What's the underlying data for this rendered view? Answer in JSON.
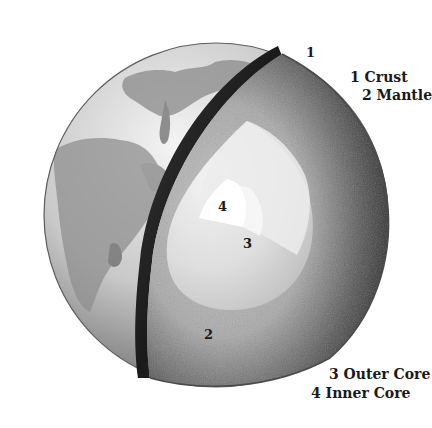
{
  "diagram": {
    "layer_markers": [
      {
        "id": "1",
        "text": "1"
      },
      {
        "id": "2",
        "text": "2"
      },
      {
        "id": "3",
        "text": "3"
      },
      {
        "id": "4",
        "text": "4"
      }
    ],
    "legend": [
      {
        "number": "1",
        "label": "Crust",
        "text": "1 Crust"
      },
      {
        "number": "2",
        "label": "Mantle",
        "text": "2 Mantle"
      },
      {
        "number": "3",
        "label": "Outer Core",
        "text": "3 Outer Core"
      },
      {
        "number": "4",
        "label": "Inner Core",
        "text": "4 Inner Core"
      }
    ],
    "colors": {
      "background": "#ffffff",
      "surface_light": "#e6e6e6",
      "surface_dark": "#7a7a7a",
      "crust_edge": "#6e6e6e",
      "mantle_dark": "#2a2a2a",
      "mantle_light": "#b8b8b8",
      "outer_core": "#dadada",
      "inner_core": "#ffffff",
      "text": "#1a1a1a"
    }
  }
}
